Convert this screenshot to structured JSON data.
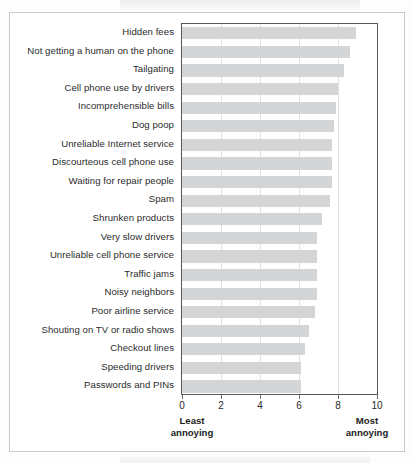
{
  "chart_data": {
    "type": "bar",
    "orientation": "horizontal",
    "title": "",
    "subtitle": "",
    "xlabel": "",
    "ylabel": "",
    "xlim": [
      0,
      10
    ],
    "grid": true,
    "legend": null,
    "bar_color": "#d4d5d6",
    "axis_color": "#555759",
    "gridline_color": "#dedfe1",
    "xticks": [
      0,
      2,
      4,
      6,
      8,
      10
    ],
    "xtick_labels": [
      "0",
      "2",
      "4",
      "6",
      "8",
      "10"
    ],
    "axis_endcap_left_line1": "Least",
    "axis_endcap_left_line2": "annoying",
    "axis_endcap_right_line1": "Most",
    "axis_endcap_right_line2": "annoying",
    "categories": [
      "Hidden fees",
      "Not getting a human on the phone",
      "Tailgating",
      "Cell phone use by drivers",
      "Incomprehensible bills",
      "Dog poop",
      "Unreliable Internet service",
      "Discourteous cell phone use",
      "Waiting for repair people",
      "Spam",
      "Shrunken products",
      "Very slow drivers",
      "Unreliable cell phone service",
      "Traffic jams",
      "Noisy neighbors",
      "Poor airline service",
      "Shouting on TV or radio shows",
      "Checkout lines",
      "Speeding drivers",
      "Passwords and PINs"
    ],
    "values": [
      8.9,
      8.6,
      8.3,
      8.0,
      7.9,
      7.8,
      7.7,
      7.7,
      7.7,
      7.6,
      7.2,
      6.9,
      6.9,
      6.9,
      6.9,
      6.8,
      6.5,
      6.3,
      6.1,
      6.1
    ]
  }
}
